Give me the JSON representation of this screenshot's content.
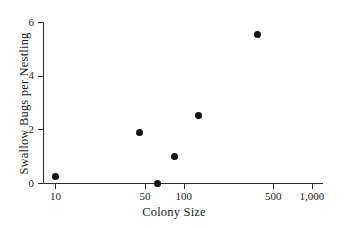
{
  "chart_data": {
    "type": "scatter",
    "title": "",
    "xlabel": "Colony Size",
    "ylabel": "Swallow Bugs per Nestling",
    "xscale": "log",
    "yscale": "linear",
    "xlim": [
      8,
      1200
    ],
    "ylim": [
      -0.35,
      6.2
    ],
    "grid": false,
    "legend": null,
    "x_tick_labels": [
      "10",
      "50",
      "100",
      "500",
      "1,000"
    ],
    "x_tick_values": [
      10,
      50,
      100,
      500,
      1000
    ],
    "y_tick_labels": [
      "0",
      "2",
      "4",
      "6"
    ],
    "y_tick_values": [
      0,
      2,
      4,
      6
    ],
    "points": [
      {
        "x": 10,
        "y": 0.25
      },
      {
        "x": 45,
        "y": 1.9
      },
      {
        "x": 62,
        "y": 0.0
      },
      {
        "x": 85,
        "y": 1.0
      },
      {
        "x": 130,
        "y": 2.5
      },
      {
        "x": 380,
        "y": 5.55
      }
    ],
    "marker": "filled-circle",
    "marker_color": "#111111",
    "axis_color": "#2b2b2b",
    "background_color": "#ffffff"
  }
}
